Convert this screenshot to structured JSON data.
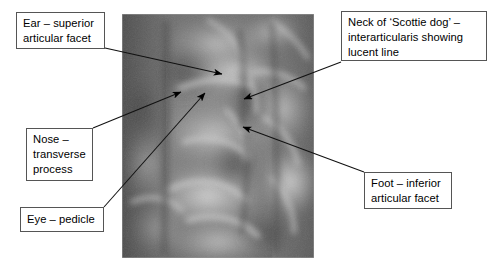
{
  "figure": {
    "background_color": "#ffffff",
    "width": 499,
    "height": 278
  },
  "xray": {
    "name": "oblique-lumbar-spine-radiograph",
    "alt": "Grayscale oblique radiograph of the lumbar spine showing the 'Scottie dog' appearance",
    "left": 122,
    "top": 14,
    "width": 192,
    "height": 244,
    "base_color": "#6e6e6e"
  },
  "callouts": [
    {
      "id": "ear",
      "name": "callout-ear-superior-articular-facet",
      "lines": [
        "Ear – superior",
        "articular facet"
      ],
      "box": {
        "left": 16,
        "top": 12,
        "width": 89,
        "height": 37
      },
      "leader": {
        "from_x": 105,
        "from_y": 48,
        "to_x": 222,
        "to_y": 74
      }
    },
    {
      "id": "nose",
      "name": "callout-nose-transverse-process",
      "lines": [
        "Nose –",
        "transverse",
        "process"
      ],
      "box": {
        "left": 26,
        "top": 128,
        "width": 67,
        "height": 53
      },
      "leader": {
        "from_x": 93,
        "from_y": 128,
        "to_x": 181,
        "to_y": 92
      }
    },
    {
      "id": "eye",
      "name": "callout-eye-pedicle",
      "lines": [
        "Eye – pedicle"
      ],
      "box": {
        "left": 20,
        "top": 207,
        "width": 84,
        "height": 25
      },
      "leader": {
        "from_x": 104,
        "from_y": 207,
        "to_x": 205,
        "to_y": 93
      }
    },
    {
      "id": "neck",
      "name": "callout-neck-scottie-dog-pars-interarticularis",
      "lines": [
        "Neck of ‘Scottie dog’ –",
        "interarticularis showing",
        "lucent line"
      ],
      "box": {
        "left": 341,
        "top": 11,
        "width": 146,
        "height": 50
      },
      "leader": {
        "from_x": 341,
        "from_y": 62,
        "to_x": 244,
        "to_y": 99
      }
    },
    {
      "id": "foot",
      "name": "callout-foot-inferior-articular-facet",
      "lines": [
        "Foot – inferior",
        "articular facet"
      ],
      "box": {
        "left": 364,
        "top": 172,
        "width": 88,
        "height": 37
      },
      "leader": {
        "from_x": 364,
        "from_y": 172,
        "to_x": 243,
        "to_y": 127
      }
    }
  ],
  "style": {
    "box_border_color": "#555555",
    "box_fill_color": "#ffffff",
    "text_color": "#000000",
    "leader_color": "#111111",
    "arrow_color": "#000000"
  }
}
